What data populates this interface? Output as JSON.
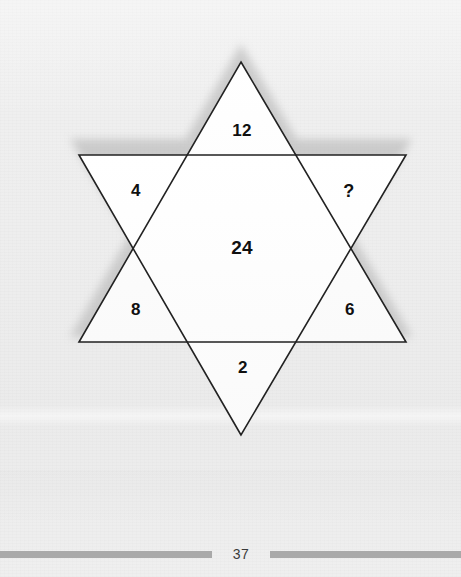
{
  "page": {
    "number": "37",
    "background_color": "#efefef"
  },
  "figure": {
    "name": "star-of-david-number-puzzle",
    "shape": "hexagram",
    "fill_color": "#fcfcfc",
    "stroke_color": "#222222",
    "shadow_color": "#bdbdbd",
    "cells": [
      {
        "id": "top",
        "value": "12",
        "position": "top-point"
      },
      {
        "id": "upper-left",
        "value": "4",
        "position": "upper-left-point"
      },
      {
        "id": "upper-right",
        "value": "?",
        "position": "upper-right-point"
      },
      {
        "id": "center",
        "value": "24",
        "position": "center-hexagon"
      },
      {
        "id": "lower-left",
        "value": "8",
        "position": "lower-left-point"
      },
      {
        "id": "lower-right",
        "value": "6",
        "position": "lower-right-point"
      },
      {
        "id": "bottom",
        "value": "2",
        "position": "bottom-point"
      }
    ]
  },
  "footer": {
    "rule_color": "#a9a9a9"
  }
}
